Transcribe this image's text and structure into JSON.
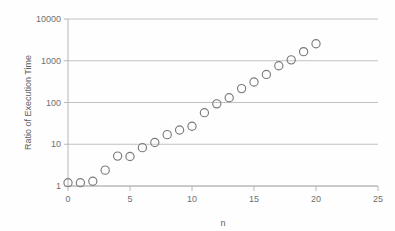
{
  "chart_data": {
    "type": "scatter",
    "title": "",
    "xlabel": "n",
    "ylabel": "Ratio of Execution Time",
    "xlim": [
      0,
      25
    ],
    "ylim": [
      1,
      10000
    ],
    "yscale": "log",
    "grid": true,
    "legend": "none",
    "xticks": [
      "0",
      "5",
      "10",
      "15",
      "20",
      "25"
    ],
    "xtick_values": [
      0,
      5,
      10,
      15,
      20,
      25
    ],
    "yticks": [
      "1",
      "10",
      "100",
      "1000",
      "10000"
    ],
    "ytick_values": [
      1,
      10,
      100,
      1000,
      10000
    ],
    "marker_style": "open-circle",
    "marker_color": "#7b7b7b",
    "series": [
      {
        "name": "Ratio of Execution Time",
        "x": [
          0,
          1,
          2,
          3,
          4,
          5,
          6,
          7,
          8,
          9,
          10,
          11,
          12,
          13,
          14,
          15,
          16,
          17,
          18,
          19,
          20
        ],
        "values": [
          1.2,
          1.2,
          1.3,
          2.4,
          5.2,
          5.1,
          8.3,
          11,
          17,
          22,
          27,
          57,
          93,
          130,
          215,
          310,
          470,
          760,
          1050,
          1650,
          2550
        ]
      }
    ]
  },
  "axis_colors": {
    "gridline": "#b3b3b3",
    "axis": "#b0b0b0",
    "tick_text": "#6f6f6f",
    "title_text": "#5e5e5e",
    "background": "#fefefe"
  }
}
